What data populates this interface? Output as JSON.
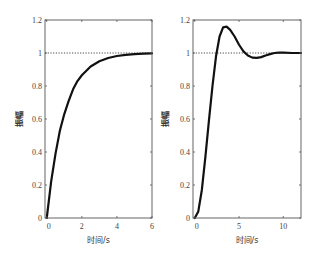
{
  "chart_data": [
    {
      "type": "line",
      "title": "",
      "xlabel": "时间/s",
      "ylabel": "振幅",
      "xlim": [
        -0.1,
        6
      ],
      "ylim": [
        0,
        1.2
      ],
      "xticks": [
        0,
        2,
        4,
        6
      ],
      "yticks": [
        0,
        0.2,
        0.4,
        0.6,
        0.8,
        1,
        1.2
      ],
      "ytick_labels": [
        "0",
        "0.2",
        "0.4",
        "0.6",
        "0.8",
        "1",
        "1.2"
      ],
      "grid": false,
      "reference_line": {
        "y": 1,
        "style": "dotted"
      },
      "series": [
        {
          "name": "first-order step response",
          "x": [
            0,
            0.25,
            0.5,
            0.75,
            1,
            1.25,
            1.5,
            1.75,
            2,
            2.5,
            3,
            3.5,
            4,
            4.5,
            5,
            5.5,
            6
          ],
          "y": [
            0,
            0.22,
            0.39,
            0.53,
            0.63,
            0.71,
            0.78,
            0.83,
            0.865,
            0.918,
            0.95,
            0.97,
            0.982,
            0.989,
            0.993,
            0.996,
            0.998
          ]
        }
      ]
    },
    {
      "type": "line",
      "title": "",
      "xlabel": "时间/s",
      "ylabel": "振幅",
      "xlim": [
        -0.2,
        12
      ],
      "ylim": [
        0,
        1.2
      ],
      "xticks": [
        0,
        5,
        10
      ],
      "yticks": [
        0,
        0.2,
        0.4,
        0.6,
        0.8,
        1,
        1.2
      ],
      "ytick_labels": [
        "0",
        "0.2",
        "0.4",
        "0.6",
        "0.8",
        "1",
        "1.2"
      ],
      "grid": false,
      "reference_line": {
        "y": 1,
        "style": "dotted"
      },
      "series": [
        {
          "name": "second-order step response",
          "x": [
            0,
            0.4,
            0.8,
            1.2,
            1.6,
            2.0,
            2.4,
            2.8,
            3.2,
            3.6,
            4.0,
            4.5,
            5.0,
            5.5,
            6.0,
            6.5,
            7.0,
            7.5,
            8.0,
            8.5,
            9.0,
            9.5,
            10,
            11,
            12
          ],
          "y": [
            0,
            0.04,
            0.17,
            0.37,
            0.59,
            0.8,
            0.98,
            1.1,
            1.155,
            1.16,
            1.14,
            1.1,
            1.05,
            1.01,
            0.985,
            0.972,
            0.97,
            0.975,
            0.985,
            0.993,
            1.0,
            1.002,
            1.002,
            1.0,
            1.0
          ]
        }
      ]
    }
  ]
}
